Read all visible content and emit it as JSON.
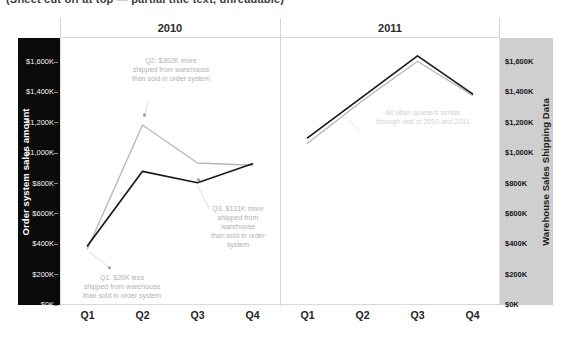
{
  "top_clipped_text": "(Sheet cut off at top — partial title text, unreadable)",
  "header": {
    "panels": [
      {
        "year": "2010"
      },
      {
        "year": "2011"
      }
    ]
  },
  "axes": {
    "left": {
      "title": "Order system sales amount",
      "ticks": [
        "$1,600K",
        "$1,400K",
        "$1,200K",
        "$1,000K",
        "$800K",
        "$600K",
        "$400K",
        "$200K",
        "$0K"
      ],
      "background": "#0b0b0b",
      "text_color": "#ffffff"
    },
    "right": {
      "title": "Warehouse Sales Shipping Data",
      "ticks": [
        "$1,600K",
        "$1,400K",
        "$1,200K",
        "$1,000K",
        "$800K",
        "$600K",
        "$400K",
        "$200K",
        "$0K"
      ],
      "background": "#cfcfcf",
      "text_color": "#161616"
    }
  },
  "x_axis": {
    "labels_2010": [
      "Q1",
      "Q2",
      "Q3",
      "Q4"
    ],
    "labels_2011": [
      "Q1",
      "Q2",
      "Q3",
      "Q4"
    ]
  },
  "annotations": [
    {
      "id": "q2-2010",
      "text": "Q2. $302K more\nshipped from warehouse\nthan sold in order system",
      "color": "#b2b2b2"
    },
    {
      "id": "q3-2010",
      "text": "Q3. $131K more\nshipped from\nwarehouse\nthan sold in order\nsystem",
      "color": "#b2b2b2"
    },
    {
      "id": "q1-2010",
      "text": "Q1. $20K less\nshipped from warehouse\nthan sold in order system",
      "color": "#b2b2b2"
    },
    {
      "id": "rest-similar",
      "text": "All other quarters similar\nthrough rest of 2010 and 2011",
      "color": "#d2d2d2"
    }
  ],
  "chart_data": {
    "type": "line",
    "title": "",
    "xlabel": "",
    "ylabel": "Order system sales amount",
    "y2label": "Warehouse Sales Shipping Data",
    "ylim": [
      0,
      1700000
    ],
    "y2lim": [
      0,
      1700000
    ],
    "grid": false,
    "legend": "none",
    "panels": [
      "2010",
      "2011"
    ],
    "categories": [
      "Q1",
      "Q2",
      "Q3",
      "Q4"
    ],
    "series": [
      {
        "name": "Order system sales amount",
        "color": "#1a1a1a",
        "axis": "left",
        "values_2010": [
          390000,
          880000,
          805000,
          930000
        ],
        "values_2011": [
          1100000,
          1370000,
          1640000,
          1390000
        ]
      },
      {
        "name": "Warehouse Sales Shipping Data",
        "color": "#b8b8b8",
        "axis": "right",
        "values_2010": [
          370000,
          1185000,
          935000,
          920000
        ],
        "values_2011": [
          1065000,
          1345000,
          1605000,
          1380000
        ]
      }
    ]
  },
  "colors": {
    "order_line": "#1a1a1a",
    "warehouse_line": "#b8b8b8",
    "left_axis_bg": "#0b0b0b",
    "right_axis_bg": "#cfcfcf",
    "annotation": "#b2b2b2",
    "background": "#ffffff"
  }
}
